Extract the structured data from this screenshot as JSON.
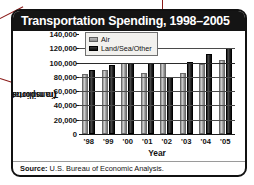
{
  "chart_data": {
    "type": "bar",
    "title": "Transportation Spending, 1998–2005",
    "xlabel": "Year",
    "ylabel": "Transportation dollars\n(in millions)",
    "ylabel_line1": "Transportation dollars",
    "ylabel_line2": "(in millions)",
    "categories": [
      "'98",
      "'99",
      "'00",
      "'01",
      "'02",
      "'03",
      "'04",
      "'05"
    ],
    "series": [
      {
        "name": "Air",
        "color": "#a8a8a8",
        "values": [
          84000,
          90000,
          100000,
          86000,
          100000,
          86000,
          98000,
          103000
        ]
      },
      {
        "name": "Land/Sea/Other",
        "color": "#141414",
        "values": [
          90000,
          97000,
          100000,
          100000,
          80000,
          101000,
          112000,
          120000
        ]
      }
    ],
    "yticks": [
      140000,
      120000,
      100000,
      80000,
      60000,
      40000,
      20000,
      0
    ],
    "ytick_labels": [
      "140,000",
      "120,000",
      "100,000",
      "80,000",
      "60,000",
      "40,000",
      "20,000",
      "0"
    ],
    "ylim": [
      0,
      140000
    ],
    "grid": true,
    "legend_position": "top-left-inside"
  },
  "source": {
    "label": "Source:",
    "text": "U.S. Bureau of Economic Analysis."
  },
  "annotations": {
    "color": "#8a1a18",
    "pointers": [
      "title-callout",
      "ylabel-callout",
      "data-point-callout"
    ]
  }
}
